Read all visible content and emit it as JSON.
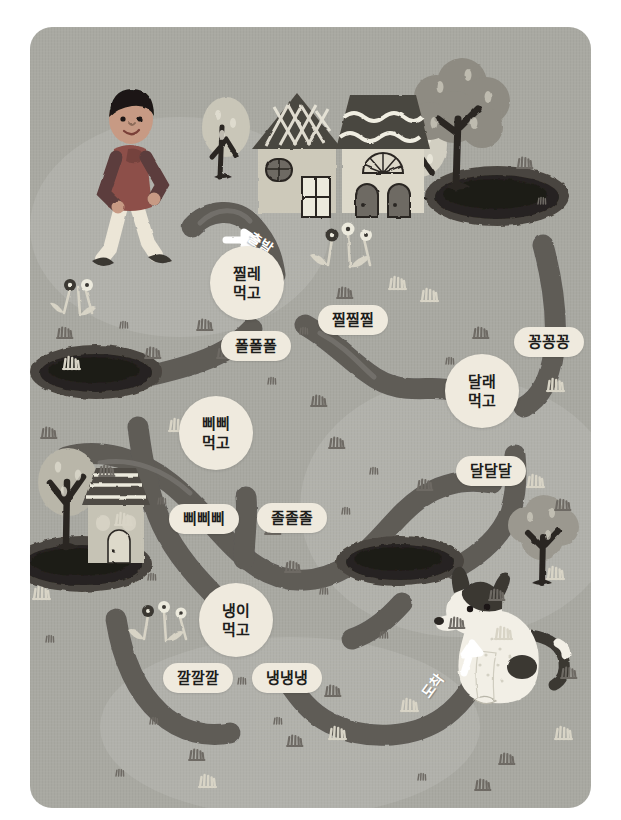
{
  "illustration": {
    "title": "Spring foraging maze",
    "card": {
      "bg_color": "#a9a9a2",
      "radius": 22
    },
    "colors": {
      "background": "#a9a9a2",
      "path": "#5e5b57",
      "chip": "#efeade",
      "text": "#1d1d1b",
      "pond_dark": "#2a2724",
      "pond_rim": "#4a453f",
      "grass_light": "#d8d4c6",
      "grass_dark": "#6e6a64",
      "tree_trunk": "#2b2724",
      "boy_shirt": "#8d5049",
      "boy_sleeve": "#5b3d3c",
      "boy_pants": "#ece6d7",
      "house_wall": "#ddd8c9",
      "house_roof": "#4f4b46",
      "dog_body": "#f2efe6",
      "dog_patch": "#3a3733"
    }
  },
  "path": {
    "start_label": "출발",
    "end_label": "도착",
    "start_arrow": "arrow-right",
    "end_arrow": "arrow-up"
  },
  "nodes": [
    {
      "name": "node-jjille",
      "line1": "찔레",
      "line2": "먹고",
      "x": 247,
      "y": 283
    },
    {
      "name": "node-dallae",
      "line1": "달래",
      "line2": "먹고",
      "x": 482,
      "y": 391
    },
    {
      "name": "node-ppippi",
      "line1": "삐삐",
      "line2": "먹고",
      "x": 216,
      "y": 433
    },
    {
      "name": "node-naengi",
      "line1": "냉이",
      "line2": "먹고",
      "x": 236,
      "y": 620
    }
  ],
  "chips": [
    {
      "name": "chip-jjiljjiljjil",
      "label": "찔찔찔",
      "x": 353,
      "y": 320
    },
    {
      "name": "chip-polpolpol",
      "label": "폴폴폴",
      "x": 256,
      "y": 346
    },
    {
      "name": "chip-kkongkkongkkong",
      "label": "꽁꽁꽁",
      "x": 549,
      "y": 342
    },
    {
      "name": "chip-daldaldal",
      "label": "달달달",
      "x": 491,
      "y": 471
    },
    {
      "name": "chip-ppippippi",
      "label": "삐삐삐",
      "x": 204,
      "y": 519
    },
    {
      "name": "chip-joljoljol",
      "label": "졸졸졸",
      "x": 292,
      "y": 518
    },
    {
      "name": "chip-kkalkkalkkal",
      "label": "깔깔깔",
      "x": 198,
      "y": 678
    },
    {
      "name": "chip-naengnaengnaeng",
      "label": "냉냉냉",
      "x": 287,
      "y": 678
    }
  ],
  "scenery": {
    "boy": {
      "name": "walking-boy",
      "x": 133,
      "y": 145
    },
    "houses": [
      {
        "name": "house-checkered-roof",
        "x": 288,
        "y": 125
      },
      {
        "name": "house-wavy-roof",
        "x": 362,
        "y": 125
      },
      {
        "name": "house-small-striped",
        "x": 110,
        "y": 500
      }
    ],
    "trees": [
      {
        "name": "tree-light-left",
        "x": 224,
        "y": 125
      },
      {
        "name": "tree-light-mid",
        "x": 419,
        "y": 130
      },
      {
        "name": "tree-dark-right",
        "x": 462,
        "y": 110
      },
      {
        "name": "tree-left-lower",
        "x": 68,
        "y": 487
      },
      {
        "name": "tree-right-lower",
        "x": 540,
        "y": 520
      }
    ],
    "ponds": [
      {
        "name": "pond-top-right",
        "x": 497,
        "y": 196
      },
      {
        "name": "pond-mid-left",
        "x": 96,
        "y": 372
      },
      {
        "name": "pond-bottom-left",
        "x": 82,
        "y": 564
      },
      {
        "name": "pond-bottom-mid",
        "x": 400,
        "y": 561
      }
    ],
    "flowers": [
      {
        "name": "flower-cluster-left-upper",
        "x": 72,
        "y": 272
      },
      {
        "name": "flower-cluster-mid-upper",
        "x": 358,
        "y": 212
      },
      {
        "name": "flower-cluster-left-lower",
        "x": 160,
        "y": 612
      }
    ],
    "dog": {
      "name": "sitting-dog",
      "x": 500,
      "y": 630
    }
  }
}
